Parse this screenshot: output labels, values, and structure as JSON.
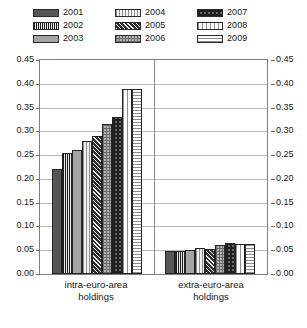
{
  "legend": {
    "items": [
      {
        "label": "2001",
        "pattern": "solid-dark-gray"
      },
      {
        "label": "2002",
        "pattern": "vertical-stripe-dark"
      },
      {
        "label": "2003",
        "pattern": "solid-light-gray"
      },
      {
        "label": "2004",
        "pattern": "vertical-stripe-light"
      },
      {
        "label": "2005",
        "pattern": "diagonal-hatch-dark"
      },
      {
        "label": "2006",
        "pattern": "fine-checker-light"
      },
      {
        "label": "2007",
        "pattern": "checker-dark"
      },
      {
        "label": "2008",
        "pattern": "vertical-stripe-white"
      },
      {
        "label": "2009",
        "pattern": "horizontal-stripe-white"
      }
    ]
  },
  "axis": {
    "ticks": [
      "0.45",
      "0.40",
      "0.35",
      "0.30",
      "0.25",
      "0.20",
      "0.15",
      "0.10",
      "0.05",
      "0.00"
    ]
  },
  "categories": [
    {
      "line1": "intra-euro-area",
      "line2": "holdings"
    },
    {
      "line1": "extra-euro-area",
      "line2": "holdings"
    }
  ],
  "chart_data": {
    "type": "bar",
    "title": "",
    "xlabel": "",
    "ylabel": "",
    "ylim": [
      0.0,
      0.45
    ],
    "ytick_step": 0.05,
    "grid": true,
    "legend_position": "top",
    "dual_y_axis": true,
    "categories": [
      "intra-euro-area holdings",
      "extra-euro-area holdings"
    ],
    "series": [
      {
        "name": "2001",
        "values": [
          0.22,
          0.048
        ]
      },
      {
        "name": "2002",
        "values": [
          0.255,
          0.048
        ]
      },
      {
        "name": "2003",
        "values": [
          0.26,
          0.05
        ]
      },
      {
        "name": "2004",
        "values": [
          0.28,
          0.055
        ]
      },
      {
        "name": "2005",
        "values": [
          0.29,
          0.053
        ]
      },
      {
        "name": "2006",
        "values": [
          0.315,
          0.06
        ]
      },
      {
        "name": "2007",
        "values": [
          0.33,
          0.065
        ]
      },
      {
        "name": "2008",
        "values": [
          0.39,
          0.063
        ]
      },
      {
        "name": "2009",
        "values": [
          0.39,
          0.063
        ]
      }
    ]
  }
}
